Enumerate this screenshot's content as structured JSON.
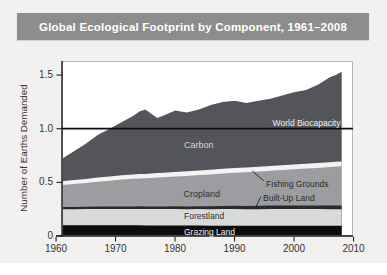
{
  "title": "Global Ecological Footprint by Component, 1961–2008",
  "colors": {
    "page_bg": "#f2f1ef",
    "title_bar_bg": "#8d8d8d",
    "title_text": "#ffffff",
    "plot_bg": "#ffffff",
    "frame": "#b5b4b2",
    "axis": "#1a1a1a",
    "tick_text": "#333333",
    "reference_line": "#0e0e0e"
  },
  "chart_data": {
    "type": "area",
    "stacked": true,
    "title": "Global Ecological Footprint by Component, 1961–2008",
    "xlabel": "",
    "ylabel": "Number of Earths Demanded",
    "xlim": [
      1960,
      2010
    ],
    "ylim": [
      0,
      1.55
    ],
    "x_ticks": [
      1960,
      1970,
      1980,
      1990,
      2000,
      2010
    ],
    "y_ticks": [
      0,
      0.5,
      1.0,
      1.5
    ],
    "y_tick_labels": [
      "0",
      "0.5",
      "1.0",
      "1.5"
    ],
    "grid": false,
    "legend": "labels-inside-areas",
    "x": [
      1961,
      1963,
      1965,
      1967,
      1969,
      1971,
      1973,
      1974,
      1975,
      1976,
      1977,
      1978,
      1980,
      1982,
      1984,
      1986,
      1988,
      1990,
      1992,
      1994,
      1996,
      1998,
      2000,
      2002,
      2004,
      2006,
      2007,
      2008
    ],
    "series": [
      {
        "name": "Grazing Land",
        "key": "grazing-land",
        "color": "#0c0c0c",
        "values": [
          0.1,
          0.1,
          0.1,
          0.1,
          0.1,
          0.1,
          0.1,
          0.1,
          0.099,
          0.099,
          0.098,
          0.098,
          0.098,
          0.097,
          0.097,
          0.096,
          0.096,
          0.096,
          0.095,
          0.095,
          0.095,
          0.095,
          0.095,
          0.095,
          0.095,
          0.095,
          0.095,
          0.095
        ]
      },
      {
        "name": "Forestland",
        "key": "forestland",
        "color": "#d8d9da",
        "values": [
          0.15,
          0.15,
          0.151,
          0.152,
          0.152,
          0.153,
          0.153,
          0.153,
          0.152,
          0.152,
          0.153,
          0.153,
          0.153,
          0.153,
          0.154,
          0.154,
          0.155,
          0.155,
          0.155,
          0.155,
          0.156,
          0.156,
          0.156,
          0.156,
          0.156,
          0.155,
          0.155,
          0.155
        ]
      },
      {
        "name": "Built-Up Land",
        "key": "built-up-land",
        "color": "#2a2a2c",
        "values": [
          0.02,
          0.021,
          0.021,
          0.022,
          0.022,
          0.023,
          0.023,
          0.024,
          0.024,
          0.024,
          0.025,
          0.025,
          0.026,
          0.026,
          0.027,
          0.028,
          0.029,
          0.03,
          0.03,
          0.031,
          0.032,
          0.032,
          0.033,
          0.034,
          0.034,
          0.035,
          0.035,
          0.035
        ]
      },
      {
        "name": "Cropland",
        "key": "cropland",
        "color": "#9b9da0",
        "values": [
          0.205,
          0.214,
          0.223,
          0.232,
          0.241,
          0.25,
          0.257,
          0.26,
          0.263,
          0.266,
          0.269,
          0.272,
          0.278,
          0.284,
          0.29,
          0.296,
          0.302,
          0.308,
          0.314,
          0.32,
          0.326,
          0.332,
          0.338,
          0.344,
          0.35,
          0.358,
          0.362,
          0.365
        ]
      },
      {
        "name": "Fishing Grounds",
        "key": "fishing-grounds",
        "color": "#f3f3f1",
        "values": [
          0.035,
          0.036,
          0.037,
          0.038,
          0.039,
          0.04,
          0.04,
          0.041,
          0.041,
          0.041,
          0.042,
          0.042,
          0.042,
          0.043,
          0.043,
          0.043,
          0.044,
          0.044,
          0.044,
          0.044,
          0.044,
          0.045,
          0.045,
          0.045,
          0.045,
          0.045,
          0.045,
          0.045
        ]
      },
      {
        "name": "Carbon",
        "key": "carbon",
        "color": "#54555a",
        "values": [
          0.21,
          0.269,
          0.328,
          0.396,
          0.446,
          0.494,
          0.547,
          0.582,
          0.601,
          0.558,
          0.513,
          0.53,
          0.573,
          0.547,
          0.569,
          0.603,
          0.624,
          0.627,
          0.602,
          0.615,
          0.627,
          0.65,
          0.673,
          0.686,
          0.73,
          0.792,
          0.808,
          0.835
        ]
      }
    ],
    "reference_line": {
      "label": "World Biocapacity",
      "value": 1.0
    },
    "annotations": [
      {
        "text": "World Biocapacity",
        "x": 2007.8,
        "y": 1.045,
        "anchor": "end",
        "color": "#f2f2f2",
        "size": 8.5
      },
      {
        "text": "Carbon",
        "x": 1984.0,
        "y": 0.84,
        "anchor": "middle",
        "color": "#d4d4d4",
        "size": 9
      },
      {
        "text": "Cropland",
        "x": 1984.5,
        "y": 0.385,
        "anchor": "middle",
        "color": "#333333",
        "size": 9
      },
      {
        "text": "Fishing Grounds",
        "x": 1995.3,
        "y": 0.475,
        "anchor": "start",
        "color": "#2c2c2c",
        "size": 8.5,
        "leader": [
          1994.9,
          0.515,
          1993.0,
          0.605
        ]
      },
      {
        "text": "Built-Up Land",
        "x": 1994.8,
        "y": 0.345,
        "anchor": "start",
        "color": "#2c2c2c",
        "size": 8.5,
        "leader": [
          1994.4,
          0.365,
          1993.4,
          0.25
        ]
      },
      {
        "text": "Forestland",
        "x": 1981.5,
        "y": 0.177,
        "anchor": "start",
        "color": "#2e2e2e",
        "size": 8.5
      },
      {
        "text": "Grazing Land",
        "x": 1981.5,
        "y": 0.034,
        "anchor": "start",
        "color": "#f0f0f0",
        "size": 8.5
      }
    ]
  }
}
